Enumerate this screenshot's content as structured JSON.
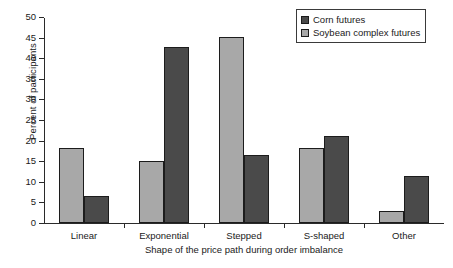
{
  "chart_data": {
    "type": "bar",
    "title": "",
    "xlabel": "Shape of the price path during order imbalance",
    "ylabel": "Percent of participants",
    "categories": [
      "Linear",
      "Exponential",
      "Stepped",
      "S-shaped",
      "Other"
    ],
    "series": [
      {
        "name": "Corn futures",
        "color": "#4a4a4a",
        "values": [
          6.5,
          42.7,
          16.5,
          21.2,
          11.5
        ]
      },
      {
        "name": "Soybean complex futures",
        "color": "#a8a8a8",
        "values": [
          18.2,
          15.0,
          45.2,
          18.2,
          3.0
        ]
      }
    ],
    "series_order_in_group": [
      "Soybean complex futures",
      "Corn futures"
    ],
    "ylim": [
      0,
      50
    ],
    "yticks": [
      0,
      5,
      10,
      15,
      20,
      25,
      30,
      35,
      40,
      45,
      50
    ],
    "ytick_labels": [
      "0",
      "5",
      "10",
      "15",
      "20",
      "25",
      "30",
      "35",
      "40",
      "45",
      "50"
    ],
    "grid": false,
    "legend_position": "top-right",
    "legend_entries": [
      "Corn futures",
      "Soybean complex futures"
    ]
  }
}
